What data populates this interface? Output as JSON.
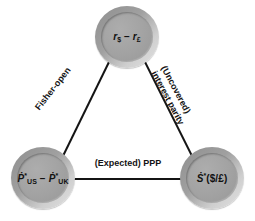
{
  "diagram": {
    "background_color": "#ffffff",
    "edge_color": "#141414",
    "node_ring_color": "#9a9a9a",
    "node_fill_color": "#a3a3a3",
    "text_color": "#111111",
    "nodes": [
      {
        "id": "interest-differential",
        "name": "interest-rate-differential-node",
        "label_plain": "r$ - r£",
        "label_parts": [
          {
            "text": "r",
            "style": "italic"
          },
          {
            "text": "$",
            "style": "sub"
          },
          {
            "text": " − ",
            "style": "normal"
          },
          {
            "text": "r",
            "style": "italic"
          },
          {
            "text": "£",
            "style": "sub"
          }
        ],
        "position": "top"
      },
      {
        "id": "inflation-differential",
        "name": "expected-inflation-differential-node",
        "label_plain": "Ṗ*US - Ṗ*UK",
        "label_parts": [
          {
            "text": "Ṗ",
            "style": "italic"
          },
          {
            "text": "*",
            "style": "sup"
          },
          {
            "text": "US",
            "style": "sub"
          },
          {
            "text": " − ",
            "style": "normal"
          },
          {
            "text": "Ṗ",
            "style": "italic"
          },
          {
            "text": "*",
            "style": "sup"
          },
          {
            "text": "UK",
            "style": "sub"
          }
        ],
        "position": "bottom-left"
      },
      {
        "id": "expected-spot-change",
        "name": "expected-spot-rate-change-node",
        "label_plain": "Ṡ*($/£)",
        "label_parts": [
          {
            "text": "Ṡ",
            "style": "italic"
          },
          {
            "text": "*",
            "style": "sup"
          },
          {
            "text": "($/£)",
            "style": "normal"
          }
        ],
        "position": "bottom-right"
      }
    ],
    "edges": [
      {
        "id": "fisher-open",
        "name": "edge-fisher-open",
        "label": "Fisher-open",
        "from": "inflation-differential",
        "to": "interest-differential"
      },
      {
        "id": "uncovered-interest-parity",
        "name": "edge-uncovered-interest-parity",
        "label_line1": "(Uncovered)",
        "label_line2": "interest parity",
        "from": "interest-differential",
        "to": "expected-spot-change"
      },
      {
        "id": "expected-ppp",
        "name": "edge-expected-ppp",
        "label": "(Expected) PPP",
        "from": "inflation-differential",
        "to": "expected-spot-change"
      }
    ]
  }
}
